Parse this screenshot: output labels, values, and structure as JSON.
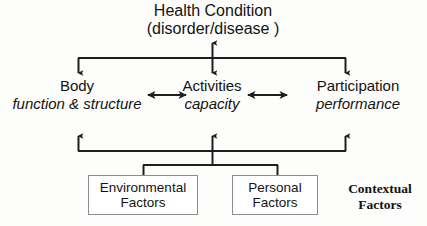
{
  "diagram": {
    "health_condition": {
      "line1": "Health Condition",
      "line2": "(disorder/disease )"
    },
    "components": [
      {
        "name": "Body",
        "sub": "function & structure"
      },
      {
        "name": "Activities",
        "sub": "capacity"
      },
      {
        "name": "Participation",
        "sub": "performance"
      }
    ],
    "factor_boxes": [
      {
        "line1": "Environmental",
        "line2": "Factors"
      },
      {
        "line1": "Personal",
        "line2": "Factors"
      }
    ],
    "contextual_label": {
      "line1": "Contextual",
      "line2": "Factors"
    },
    "colors": {
      "background": "#fdfdfb",
      "text": "#131313",
      "connector": "#1e1e1e",
      "box_border": "#8d8d8d",
      "box_fill": "#ffffff"
    }
  }
}
